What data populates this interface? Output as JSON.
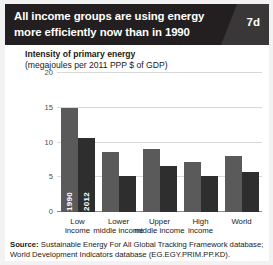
{
  "header": {
    "title": "All income groups are using energy more efficiently now than in 1990",
    "badge": "7d"
  },
  "axis_title": {
    "line1": "Intensity of primary energy",
    "line2": "(megajoules per 2011 PPP $ of GDP)"
  },
  "series_labels": {
    "y1990": "1990",
    "y2012": "2012"
  },
  "source": {
    "label": "Source:",
    "text": " Sustainable Energy For All Global Tracking Framework database; World Development Indicators database (EG.EGY.PRIM.PP.KD)."
  },
  "colors": {
    "header_bg": "#231f20",
    "badge_panel": "#3a3738",
    "bar_1990": "#5a5a5a",
    "bar_2012": "#2e2e2e",
    "gridline": "#d8d8d8",
    "axis": "#8c8c8c",
    "page_bg": "#f2f2f2"
  },
  "chart_data": {
    "type": "bar",
    "title": "Intensity of primary energy",
    "subtitle": "(megajoules per 2011 PPP $ of GDP)",
    "xlabel": "",
    "ylabel": "",
    "ylim": [
      0,
      20
    ],
    "yticks": [
      0,
      5,
      10,
      15,
      20
    ],
    "ytick_labels": [
      "0",
      "5",
      "10",
      "15",
      "20"
    ],
    "grid": true,
    "legend": "in-bar labels on first group",
    "categories": [
      "Low income",
      "Lower middle income",
      "Upper middle income",
      "High income",
      "World"
    ],
    "category_lines": [
      [
        "Low",
        "income"
      ],
      [
        "Lower",
        "middle income"
      ],
      [
        "Upper",
        "middle income"
      ],
      [
        "High",
        "income"
      ],
      [
        "World",
        ""
      ]
    ],
    "series": [
      {
        "name": "1990",
        "values": [
          15.0,
          8.6,
          9.0,
          7.2,
          8.0
        ]
      },
      {
        "name": "2012",
        "values": [
          10.6,
          5.2,
          6.6,
          5.2,
          5.8
        ]
      }
    ]
  }
}
